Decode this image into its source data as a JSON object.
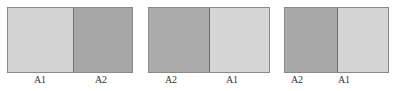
{
  "panels": [
    {
      "cells": [
        {
          "label": "A1",
          "color": "#d3d3d3"
        },
        {
          "label": "A2",
          "color": "#a6a6a6"
        }
      ]
    },
    {
      "cells": [
        {
          "label": "A2",
          "color": "#ababab"
        },
        {
          "label": "A1",
          "color": "#d6d6d6"
        }
      ]
    },
    {
      "cells": [
        {
          "label": "A2",
          "color": "#a8a8a8"
        },
        {
          "label": "A1",
          "color": "#d4d4d4"
        }
      ]
    }
  ]
}
